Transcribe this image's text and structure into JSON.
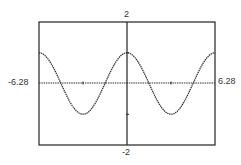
{
  "chart_data": {
    "type": "line",
    "title": "",
    "function": "y = cos(x)",
    "xlabel": "",
    "ylabel": "",
    "xlim": [
      -6.28,
      6.28
    ],
    "ylim": [
      -2,
      2
    ],
    "tick_labels": {
      "xmin": "-6.28",
      "xmax": "6.28",
      "ymax": "2",
      "ymin": "-2"
    },
    "x_ticks": [
      -3.14,
      3.14
    ],
    "y_ticks": [
      -1,
      1
    ],
    "grid": false,
    "legend": null,
    "style": "dotted graphing-calculator trace",
    "series": [
      {
        "name": "cos(x)",
        "x": [
          -6.28,
          -5.5,
          -4.71,
          -3.93,
          -3.14,
          -2.36,
          -1.57,
          -0.79,
          0,
          0.79,
          1.57,
          2.36,
          3.14,
          3.93,
          4.71,
          5.5,
          6.28
        ],
        "values": [
          1,
          0.71,
          0,
          -0.71,
          -1,
          -0.71,
          0,
          0.71,
          1,
          0.71,
          0,
          -0.71,
          -1,
          -0.71,
          0,
          0.71,
          1
        ]
      }
    ]
  },
  "colors": {
    "axis": "#222222",
    "curve": "#333333",
    "background": "#ffffff"
  }
}
